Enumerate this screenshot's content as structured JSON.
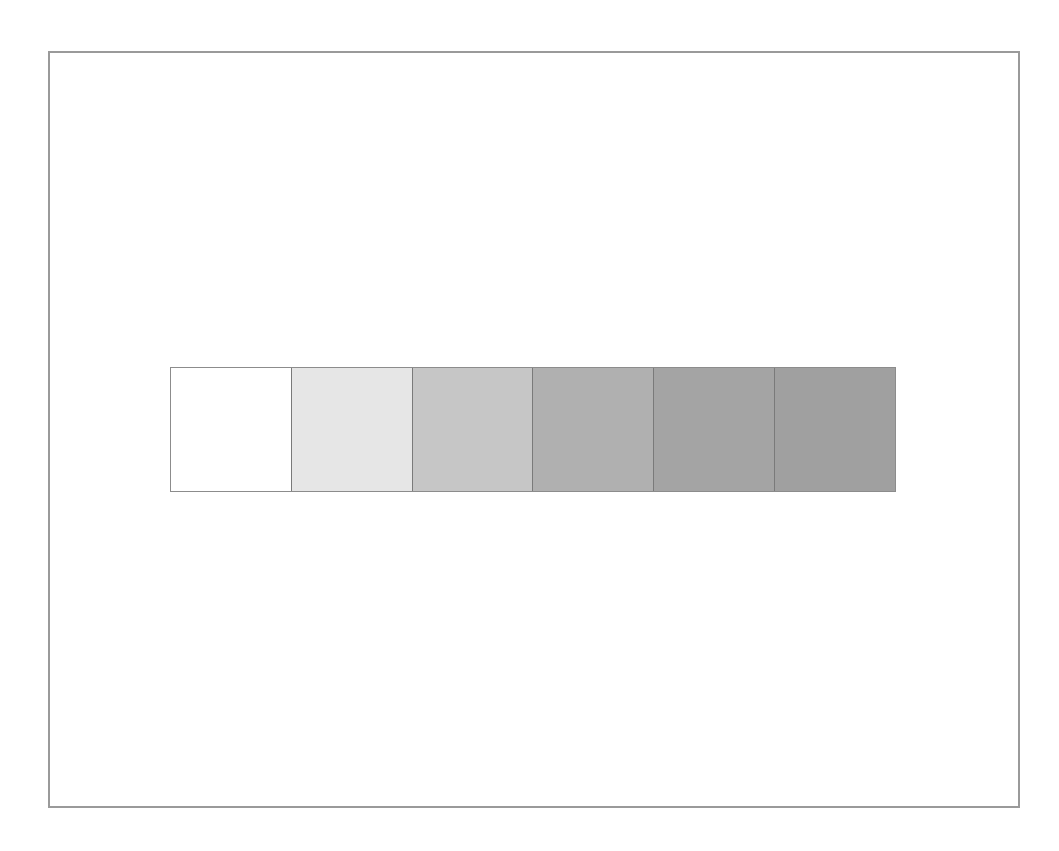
{
  "diagram": {
    "type": "grayscale-step-strip",
    "frame": {
      "border_color": "#9a9a9a"
    },
    "strip": {
      "border_color": "#8c8c8c",
      "divider_color": "#7a7a7a",
      "swatches": [
        {
          "index": 1,
          "color": "#ffffff"
        },
        {
          "index": 2,
          "color": "#e6e6e6"
        },
        {
          "index": 3,
          "color": "#c6c6c6"
        },
        {
          "index": 4,
          "color": "#b0b0b0"
        },
        {
          "index": 5,
          "color": "#a4a4a4"
        },
        {
          "index": 6,
          "color": "#a0a0a0"
        }
      ]
    }
  }
}
